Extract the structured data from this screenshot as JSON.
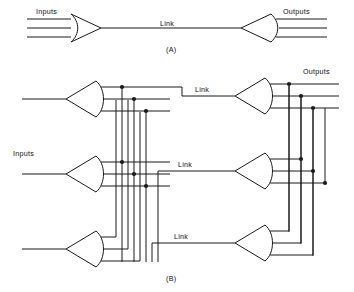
{
  "figure": {
    "background_color": "#ffffff",
    "line_color": "#1a1a1a"
  },
  "panel_a": {
    "caption": "(A)",
    "inputs_label": "Inputs",
    "outputs_label": "Outputs",
    "link_label": "Link",
    "input_line_count": 3,
    "output_line_count": 3,
    "gate_count": 2
  },
  "panel_b": {
    "caption": "(B)",
    "inputs_label": "Inputs",
    "outputs_label": "Outputs",
    "link_labels": [
      "Link",
      "Link",
      "Link"
    ],
    "left_gate_count": 3,
    "right_gate_count": 3,
    "lines_per_gate": 3,
    "link_count": 3
  }
}
